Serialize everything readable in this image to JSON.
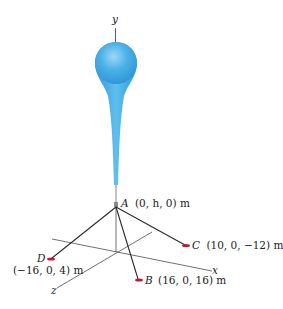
{
  "figure": {
    "axes": {
      "x_label": "x",
      "y_label": "y",
      "z_label": "z"
    },
    "points": {
      "A": {
        "name": "A",
        "coords": "(0, h, 0) m"
      },
      "B": {
        "name": "B",
        "coords": "(16, 0, 16) m"
      },
      "C": {
        "name": "C",
        "coords": "(10, 0, −12) m"
      },
      "D": {
        "name": "D",
        "coords": "(−16, 0, 4) m"
      }
    },
    "colors": {
      "balloon": "#3aa6e0",
      "balloon_highlight": "#8fd0f4",
      "anchor": "#c8163a",
      "cable": "#2b2b2b",
      "axis": "#333333"
    }
  }
}
